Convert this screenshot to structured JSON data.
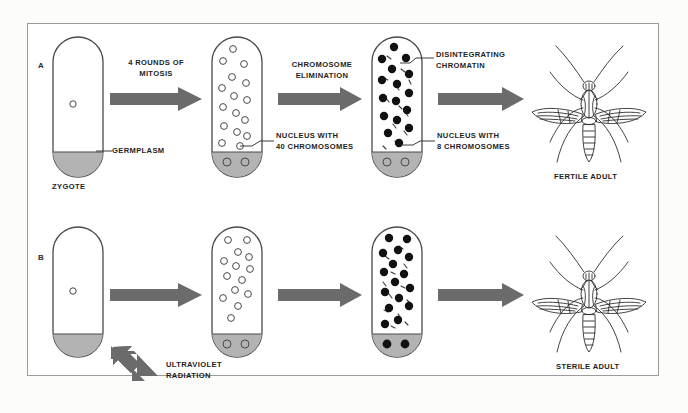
{
  "figure": {
    "title_present": false,
    "background_color": "#fcfcfa",
    "frame_color": "#9b9b9b",
    "arrow_color": "#6b6b6b",
    "germplasm_color": "#b0b0b0",
    "cell_outline_color": "#4a4a4a",
    "text_color": "#1e1e1e"
  },
  "panels": [
    {
      "letter": "A",
      "outcome_label": "FERTILE ADULT",
      "stages": [
        {
          "name": "zygote",
          "caption": "ZYGOTE",
          "nuclei_style": "single-open",
          "nuclei_count": 1,
          "has_germplasm": true,
          "germplasm_nuclei": 0,
          "chromatin": false
        },
        {
          "name": "post-mitosis",
          "caption": "",
          "nuclei_style": "open",
          "nuclei_count": 16,
          "has_germplasm": true,
          "germplasm_nuclei": 2,
          "chromatin": false
        },
        {
          "name": "post-elimination",
          "caption": "",
          "nuclei_style": "filled",
          "nuclei_count": 16,
          "has_germplasm": true,
          "germplasm_nuclei": 2,
          "chromatin": true
        }
      ],
      "transitions": [
        {
          "label": "4 ROUNDS OF\nMITOSIS"
        },
        {
          "label": "CHROMOSOME\nELIMINATION"
        },
        {
          "label": ""
        }
      ],
      "callouts": [
        {
          "text": "GERMPLASM"
        },
        {
          "text": "NUCLEUS WITH\n40 CHROMOSOMES"
        },
        {
          "text": "DISINTEGRATING\nCHROMATIN"
        },
        {
          "text": "NUCLEUS WITH\n8 CHROMOSOMES"
        }
      ]
    },
    {
      "letter": "B",
      "outcome_label": "STERILE ADULT",
      "stages": [
        {
          "name": "zygote",
          "caption": "",
          "nuclei_style": "single-open",
          "nuclei_count": 1,
          "has_germplasm": true,
          "germplasm_nuclei": 0,
          "chromatin": false
        },
        {
          "name": "post-mitosis",
          "caption": "",
          "nuclei_style": "open",
          "nuclei_count": 14,
          "has_germplasm": true,
          "germplasm_nuclei": 2,
          "chromatin": false
        },
        {
          "name": "post-elimination",
          "caption": "",
          "nuclei_style": "filled",
          "nuclei_count": 16,
          "has_germplasm": true,
          "germplasm_nuclei": 2,
          "chromatin": true
        }
      ],
      "transitions": [
        {
          "label": ""
        },
        {
          "label": ""
        },
        {
          "label": ""
        }
      ],
      "callouts": [
        {
          "text": "ULTRAVIOLET\nRADIATION"
        }
      ]
    }
  ],
  "labels": {
    "panel_a_letter": "A",
    "panel_b_letter": "B",
    "mitosis": "4 ROUNDS OF\nMITOSIS",
    "chromosome_elimination": "CHROMOSOME\nELIMINATION",
    "germplasm": "GERMPLASM",
    "zygote": "ZYGOTE",
    "nucleus_40": "NUCLEUS WITH\n40 CHROMOSOMES",
    "disintegrating_chromatin": "DISINTEGRATING\nCHROMATIN",
    "nucleus_8": "NUCLEUS WITH\n8 CHROMOSOMES",
    "fertile_adult": "FERTILE ADULT",
    "ultraviolet_radiation": "ULTRAVIOLET\nRADIATION",
    "sterile_adult": "STERILE ADULT"
  }
}
